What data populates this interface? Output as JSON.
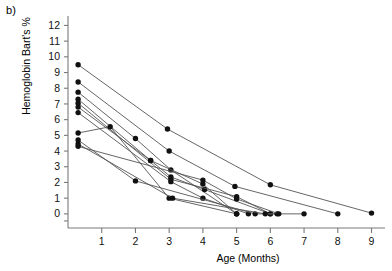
{
  "panel": {
    "label": "b)"
  },
  "chart_data": {
    "type": "line",
    "title": "",
    "subtitle": "",
    "xlabel": "Age (Months)",
    "ylabel": "Hemoglobin Bart's %",
    "xlim": [
      0,
      9.4
    ],
    "ylim": [
      -0.9,
      12.6
    ],
    "xticks": [
      1,
      2,
      3,
      4,
      5,
      6,
      7,
      8,
      9
    ],
    "yticks": [
      0,
      1,
      2,
      3,
      4,
      5,
      6,
      7,
      8,
      9,
      10,
      11,
      12
    ],
    "xtick_labels": [
      "1",
      "2",
      "3",
      "4",
      "5",
      "6",
      "7",
      "8",
      "9"
    ],
    "ytick_labels": [
      "0",
      "1",
      "2",
      "3",
      "4",
      "5",
      "6",
      "7",
      "8",
      "9",
      "10",
      "11",
      "12"
    ],
    "grid": false,
    "legend": false,
    "legend_position": "none",
    "marker": "filled-circle",
    "marker_color": "#111111",
    "line_color": "#555555",
    "series": [
      {
        "name": "subject-1",
        "x": [
          0.3,
          2.95,
          6.0,
          9.0
        ],
        "y": [
          9.5,
          5.4,
          1.85,
          0.05
        ]
      },
      {
        "name": "subject-2",
        "x": [
          0.3,
          3.0,
          4.95,
          8.0
        ],
        "y": [
          8.4,
          4.0,
          1.75,
          0.0
        ]
      },
      {
        "name": "subject-3",
        "x": [
          0.3,
          2.0,
          3.05,
          5.0
        ],
        "y": [
          7.75,
          4.8,
          2.8,
          0.0
        ]
      },
      {
        "name": "subject-4",
        "x": [
          0.3,
          2.45,
          3.05,
          4.05,
          6.0
        ],
        "y": [
          7.3,
          3.4,
          2.35,
          1.55,
          0.0
        ]
      },
      {
        "name": "subject-5",
        "x": [
          0.3,
          3.05,
          5.0,
          6.0
        ],
        "y": [
          7.05,
          2.2,
          1.1,
          0.0
        ]
      },
      {
        "name": "subject-6",
        "x": [
          0.3,
          2.45,
          4.0,
          5.0
        ],
        "y": [
          6.8,
          3.4,
          1.9,
          0.0
        ]
      },
      {
        "name": "subject-7",
        "x": [
          0.3,
          3.05,
          4.0,
          5.35
        ],
        "y": [
          6.45,
          2.05,
          1.0,
          0.0
        ]
      },
      {
        "name": "subject-8",
        "x": [
          0.3,
          1.25,
          3.0,
          5.0
        ],
        "y": [
          5.15,
          5.55,
          1.0,
          0.0
        ]
      },
      {
        "name": "subject-9",
        "x": [
          0.3,
          2.0,
          5.55,
          7.0
        ],
        "y": [
          4.7,
          2.1,
          0.0,
          0.0
        ]
      },
      {
        "name": "subject-10",
        "x": [
          0.3,
          3.1,
          5.85,
          6.2
        ],
        "y": [
          4.45,
          1.0,
          0.0,
          0.0
        ]
      },
      {
        "name": "subject-11",
        "x": [
          0.3,
          4.0,
          5.0,
          6.25
        ],
        "y": [
          4.3,
          2.15,
          0.95,
          0.0
        ]
      }
    ],
    "value_range_note": "",
    "units": "%"
  },
  "colors": {
    "axis": "#7a7a7a",
    "marker": "#111111",
    "line": "#555555",
    "text": "#111111",
    "background": "#ffffff"
  }
}
